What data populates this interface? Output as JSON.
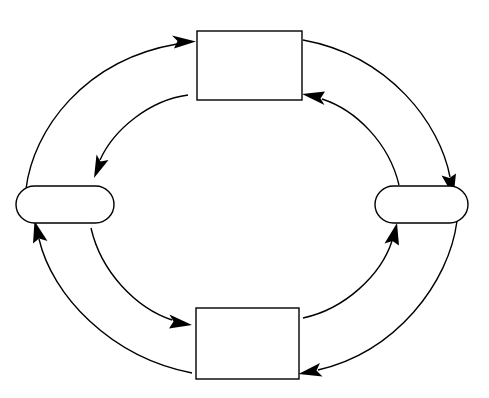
{
  "diagram": {
    "background_color": "#ffffff",
    "stroke_color": "#000000",
    "fill_color": "#ffffff",
    "stroke_width": 1.4,
    "width": 489,
    "height": 398
  },
  "nodes": [
    {
      "id": "top",
      "shape": "rectangle",
      "label": "",
      "x": 197,
      "y": 31,
      "width": 105,
      "height": 69,
      "center_x": 249.5,
      "center_y": 65.5,
      "corner_radius": 0
    },
    {
      "id": "right",
      "shape": "stadium",
      "label": "",
      "x": 375,
      "y": 186,
      "width": 93,
      "height": 37,
      "center_x": 421.5,
      "center_y": 204.5,
      "corner_radius": 18.5
    },
    {
      "id": "bottom",
      "shape": "rectangle",
      "label": "",
      "x": 196,
      "y": 308,
      "width": 103,
      "height": 71,
      "center_x": 247.5,
      "center_y": 343.5,
      "corner_radius": 0
    },
    {
      "id": "left",
      "shape": "stadium",
      "label": "",
      "x": 16,
      "y": 186,
      "width": 98,
      "height": 37,
      "center_x": 65,
      "center_y": 204.5,
      "corner_radius": 18.5
    }
  ],
  "arcs": [
    {
      "id": "outer-left-to-top",
      "ring": "outer",
      "from": "left",
      "to": "top",
      "label": "",
      "direction": "clockwise",
      "arrowhead": "end"
    },
    {
      "id": "outer-top-to-right",
      "ring": "outer",
      "from": "top",
      "to": "right",
      "label": "",
      "direction": "clockwise",
      "arrowhead": "end"
    },
    {
      "id": "outer-right-to-bottom",
      "ring": "outer",
      "from": "right",
      "to": "bottom",
      "label": "",
      "direction": "clockwise",
      "arrowhead": "end"
    },
    {
      "id": "outer-bottom-to-left",
      "ring": "outer",
      "from": "bottom",
      "to": "left",
      "label": "",
      "direction": "clockwise",
      "arrowhead": "end"
    },
    {
      "id": "inner-top-to-left",
      "ring": "inner",
      "from": "top",
      "to": "left",
      "label": "",
      "direction": "counter-clockwise",
      "arrowhead": "end"
    },
    {
      "id": "inner-left-to-bottom",
      "ring": "inner",
      "from": "left",
      "to": "bottom",
      "label": "",
      "direction": "counter-clockwise",
      "arrowhead": "end"
    },
    {
      "id": "inner-bottom-to-right",
      "ring": "inner",
      "from": "bottom",
      "to": "right",
      "label": "",
      "direction": "counter-clockwise",
      "arrowhead": "end"
    },
    {
      "id": "inner-right-to-top",
      "ring": "inner",
      "from": "right",
      "to": "top",
      "label": "",
      "direction": "counter-clockwise",
      "arrowhead": "end"
    }
  ]
}
